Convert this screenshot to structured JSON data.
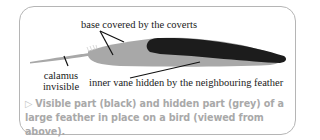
{
  "figure": {
    "labels": {
      "base": "base covered by the coverts",
      "calamus_line1": "calamus",
      "calamus_line2": "invisible",
      "inner_vane": "inner vane hidden by the neighbouring feather"
    },
    "caption": {
      "marker": "▷",
      "text": "Visible part (black) and hidden part (grey) of a large feather in place on a bird (viewed from above)."
    },
    "colors": {
      "visible_part": "#1c1c1c",
      "hidden_part": "#a8a8a8",
      "caption_text": "#a9a9a9",
      "frame_border": "#b5b5b5"
    }
  }
}
